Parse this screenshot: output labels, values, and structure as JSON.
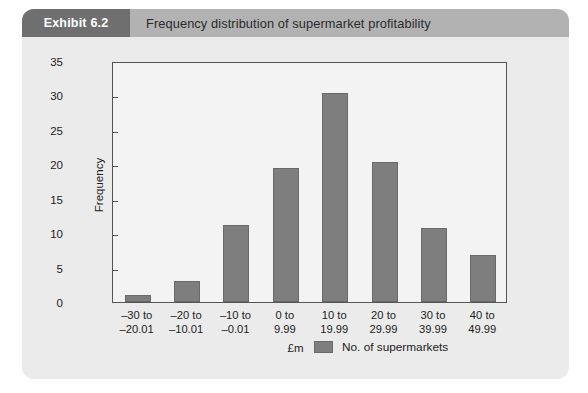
{
  "exhibit": {
    "badge": "Exhibit 6.2",
    "title": "Frequency distribution of supermarket profitability"
  },
  "colors": {
    "bar_fill": "#7e7e7e",
    "bar_stroke": "#6a6a6a",
    "card_background": "#ebebeb",
    "header_band": "#b2b2b2",
    "badge_background": "#6f6f6f",
    "plot_background": "#f3f3f3",
    "axis_line": "#555555",
    "text": "#1c1c1c"
  },
  "chart_data": {
    "type": "bar",
    "title": "Frequency distribution of supermarket profitability",
    "categories": [
      "–30 to\n–20.01",
      "–20 to\n–10.01",
      "–10 to\n–0.01",
      "0 to\n9.99",
      "10 to\n19.99",
      "20 to\n29.99",
      "30 to\n39.99",
      "40 to\n49.99"
    ],
    "values": [
      1,
      3,
      11.2,
      19.5,
      30.3,
      20.4,
      10.7,
      6.8
    ],
    "series": [
      {
        "name": "No. of supermarkets",
        "values": [
          1,
          3,
          11.2,
          19.5,
          30.3,
          20.4,
          10.7,
          6.8
        ]
      }
    ],
    "xlabel": "£m",
    "ylabel": "Frequency",
    "ylim": [
      0,
      35
    ],
    "yticks": [
      0,
      5,
      10,
      15,
      20,
      25,
      30,
      35
    ],
    "grid": false,
    "legend": {
      "position": "bottom-right",
      "entries": [
        "No. of supermarkets"
      ]
    }
  }
}
